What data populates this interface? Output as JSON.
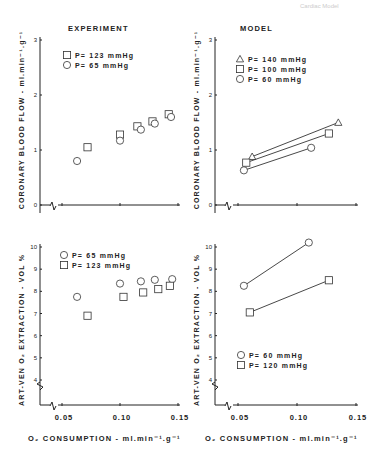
{
  "page_header": "Cardiac Model",
  "panels": {
    "top_left": {
      "title": "EXPERIMENT",
      "legend": [
        "P= 123  mmHg",
        "P=  65  mmHg"
      ]
    },
    "top_right": {
      "title": "MODEL",
      "legend": [
        "P= 140  mmHg",
        "P= 100  mmHg",
        "P=  60  mmHg"
      ]
    },
    "bottom_left": {
      "legend": [
        "P=  65  mmHg",
        "P= 123  mmHg"
      ]
    },
    "bottom_right": {
      "legend": [
        "P=  60  mmHg",
        "P= 120  mmHg"
      ]
    }
  },
  "axes": {
    "top_ylabel": "CORONARY BLOOD FLOW - ml.min⁻¹.g⁻¹",
    "bottom_ylabel": "ART-VEN O₂ EXTRACTION - VOL %",
    "xlabel": "O₂  CONSUMPTION - ml.min⁻¹.g⁻¹",
    "top_yticks": [
      "0",
      "1",
      "2",
      "3"
    ],
    "bottom_yticks": [
      "4",
      "5",
      "6",
      "7",
      "8",
      "9",
      "10"
    ],
    "xticks": [
      "0.05",
      "0.10",
      "0.15"
    ]
  },
  "chart_data": [
    {
      "type": "scatter",
      "title": "EXPERIMENT",
      "xlabel": "O2 CONSUMPTION - ml.min-1.g-1",
      "ylabel": "CORONARY BLOOD FLOW - ml.min-1.g-1",
      "xlim": [
        0.04,
        0.15
      ],
      "ylim": [
        0,
        3
      ],
      "series": [
        {
          "name": "P= 123 mmHg",
          "marker": "square",
          "x": [
            0.072,
            0.1,
            0.115,
            0.128,
            0.142
          ],
          "y": [
            1.05,
            1.28,
            1.43,
            1.52,
            1.65
          ]
        },
        {
          "name": "P= 65 mmHg",
          "marker": "circle",
          "x": [
            0.063,
            0.1,
            0.118,
            0.13,
            0.144
          ],
          "y": [
            0.8,
            1.17,
            1.37,
            1.48,
            1.6
          ]
        }
      ]
    },
    {
      "type": "line",
      "title": "MODEL",
      "xlabel": "O2 CONSUMPTION - ml.min-1.g-1",
      "ylabel": "CORONARY BLOOD FLOW - ml.min-1.g-1",
      "xlim": [
        0.04,
        0.15
      ],
      "ylim": [
        0,
        3
      ],
      "series": [
        {
          "name": "P= 140 mmHg",
          "marker": "triangle",
          "x": [
            0.062,
            0.135
          ],
          "y": [
            0.88,
            1.5
          ]
        },
        {
          "name": "P= 100 mmHg",
          "marker": "square",
          "x": [
            0.057,
            0.127
          ],
          "y": [
            0.77,
            1.3
          ]
        },
        {
          "name": "P= 60 mmHg",
          "marker": "circle",
          "x": [
            0.055,
            0.112
          ],
          "y": [
            0.63,
            1.04
          ]
        }
      ]
    },
    {
      "type": "scatter",
      "title": "",
      "xlabel": "O2 CONSUMPTION - ml.min-1.g-1",
      "ylabel": "ART-VEN O2 EXTRACTION - VOL %",
      "xlim": [
        0.04,
        0.15
      ],
      "ylim": [
        4,
        10
      ],
      "series": [
        {
          "name": "P= 65 mmHg",
          "marker": "circle",
          "x": [
            0.063,
            0.1,
            0.118,
            0.13,
            0.145
          ],
          "y": [
            7.75,
            8.35,
            8.45,
            8.52,
            8.55
          ]
        },
        {
          "name": "P= 123 mmHg",
          "marker": "square",
          "x": [
            0.072,
            0.103,
            0.12,
            0.133,
            0.143
          ],
          "y": [
            6.9,
            7.75,
            7.95,
            8.1,
            8.25
          ]
        }
      ]
    },
    {
      "type": "line",
      "title": "",
      "xlabel": "O2 CONSUMPTION - ml.min-1.g-1",
      "ylabel": "ART-VEN O2 EXTRACTION - VOL %",
      "xlim": [
        0.04,
        0.15
      ],
      "ylim": [
        4,
        10
      ],
      "series": [
        {
          "name": "P= 60 mmHg",
          "marker": "circle",
          "x": [
            0.055,
            0.11
          ],
          "y": [
            8.25,
            10.2
          ]
        },
        {
          "name": "P= 120 mmHg",
          "marker": "square",
          "x": [
            0.06,
            0.127
          ],
          "y": [
            7.05,
            8.5
          ]
        }
      ]
    }
  ]
}
